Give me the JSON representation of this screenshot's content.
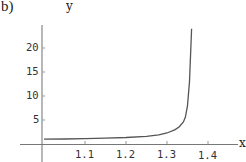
{
  "panel_label": "b)",
  "chart_data": {
    "type": "line",
    "title": "",
    "xlabel": "x",
    "ylabel": "y",
    "xlim": [
      1.0,
      1.45
    ],
    "ylim": [
      0,
      24
    ],
    "x_ticks": [
      "1.1",
      "1.2",
      "1.3",
      "1.4"
    ],
    "y_ticks": [
      "5",
      "10",
      "15",
      "20"
    ],
    "grid": false,
    "series": [
      {
        "name": "y(x)",
        "x": [
          1.0,
          1.05,
          1.1,
          1.15,
          1.2,
          1.25,
          1.28,
          1.3,
          1.32,
          1.33,
          1.34,
          1.345,
          1.35,
          1.355,
          1.36
        ],
        "values": [
          1.0,
          1.05,
          1.1,
          1.2,
          1.35,
          1.6,
          1.9,
          2.3,
          3.0,
          3.6,
          4.6,
          5.6,
          8.0,
          13.0,
          24.0
        ]
      }
    ],
    "vertical_asymptote_x": 1.36,
    "color": "#555555"
  }
}
